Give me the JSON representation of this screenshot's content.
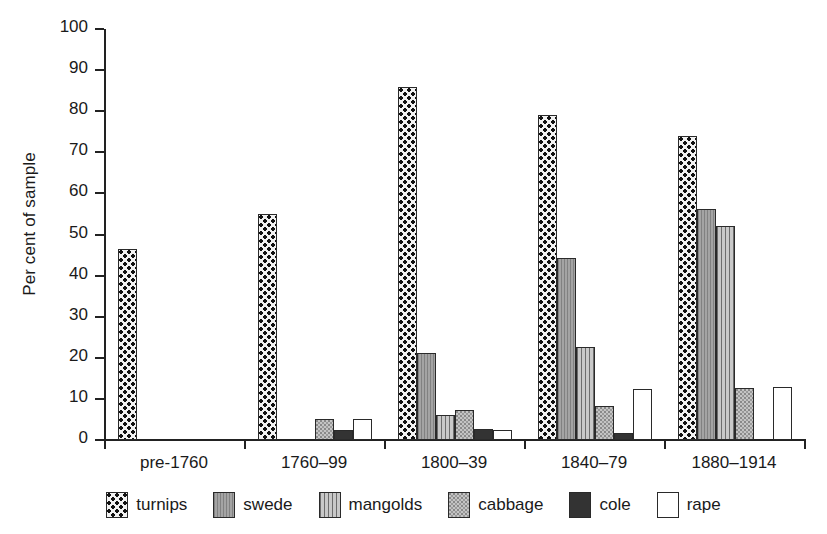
{
  "chart_data": {
    "type": "bar",
    "title": "",
    "xlabel": "",
    "ylabel": "Per cent of sample",
    "ylim": [
      0,
      100
    ],
    "yticks": [
      0,
      10,
      20,
      30,
      40,
      50,
      60,
      70,
      80,
      90,
      100
    ],
    "grid": false,
    "legend_position": "bottom",
    "categories": [
      "pre-1760",
      "1760–99",
      "1800–39",
      "1840–79",
      "1880–1914"
    ],
    "series": [
      {
        "name": "turnips",
        "pattern": "checkerboard",
        "color": "#f2f2f2",
        "values": [
          46.5,
          55.0,
          86.0,
          79.0,
          74.0
        ]
      },
      {
        "name": "swede",
        "pattern": "solid-gray",
        "color": "#9a9a9a",
        "values": [
          0,
          0,
          21.2,
          44.4,
          56.2
        ]
      },
      {
        "name": "mangolds",
        "pattern": "vertical-lines",
        "color": "#b2b2b2",
        "values": [
          0,
          0,
          6.0,
          22.7,
          52.0
        ]
      },
      {
        "name": "cabbage",
        "pattern": "light-stipple",
        "color": "#c4c4c4",
        "values": [
          0,
          5.2,
          7.4,
          8.2,
          12.6
        ]
      },
      {
        "name": "cole",
        "pattern": "solid-dark",
        "color": "#333333",
        "values": [
          0,
          2.5,
          2.8,
          1.6,
          0
        ]
      },
      {
        "name": "rape",
        "pattern": "white",
        "color": "#ffffff",
        "values": [
          0,
          5.2,
          2.5,
          12.4,
          12.8
        ]
      }
    ]
  },
  "axis": {
    "y_label": "Per cent of sample",
    "y_ticks": [
      "0",
      "10",
      "20",
      "30",
      "40",
      "50",
      "60",
      "70",
      "80",
      "90",
      "100"
    ],
    "x_categories": [
      "pre-1760",
      "1760–99",
      "1800–39",
      "1840–79",
      "1880–1914"
    ]
  },
  "legend": {
    "items": [
      {
        "label": "turnips"
      },
      {
        "label": "swede"
      },
      {
        "label": "mangolds"
      },
      {
        "label": "cabbage"
      },
      {
        "label": "cole"
      },
      {
        "label": "rape"
      }
    ]
  }
}
